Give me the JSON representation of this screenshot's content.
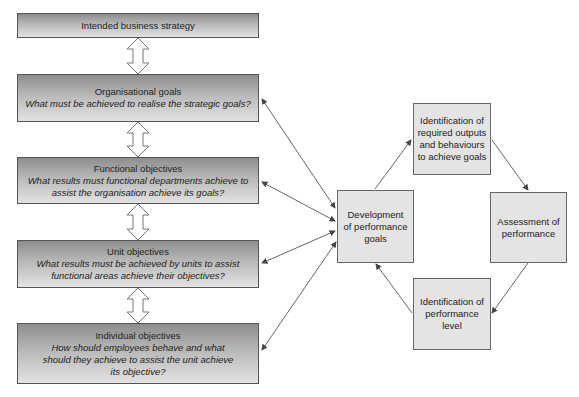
{
  "hierarchy": [
    {
      "title": "Intended business strategy",
      "question": ""
    },
    {
      "title": "Organisational goals",
      "question": "What must be achieved to realise the strategic goals?"
    },
    {
      "title": "Functional objectives",
      "question": "What results must functional departments achieve to assist the organisation achieve its goals?"
    },
    {
      "title": "Unit objectives",
      "question": "What results must be achieved by units to assist functional areas achieve their objectives?"
    },
    {
      "title": "Individual objectives",
      "question": "How should employees behave and what should they achieve to assist the unit achieve its objective?"
    }
  ],
  "cycle": {
    "development": "Development of performance goals",
    "identification_outputs": "Identification of required outputs and behaviours to achieve goals",
    "assessment": "Assessment of performance",
    "identification_level": "Identification of performance level"
  },
  "colors": {
    "box_border": "#555555",
    "cycle_fill": "#e4e4e4",
    "arrow": "#555555"
  }
}
